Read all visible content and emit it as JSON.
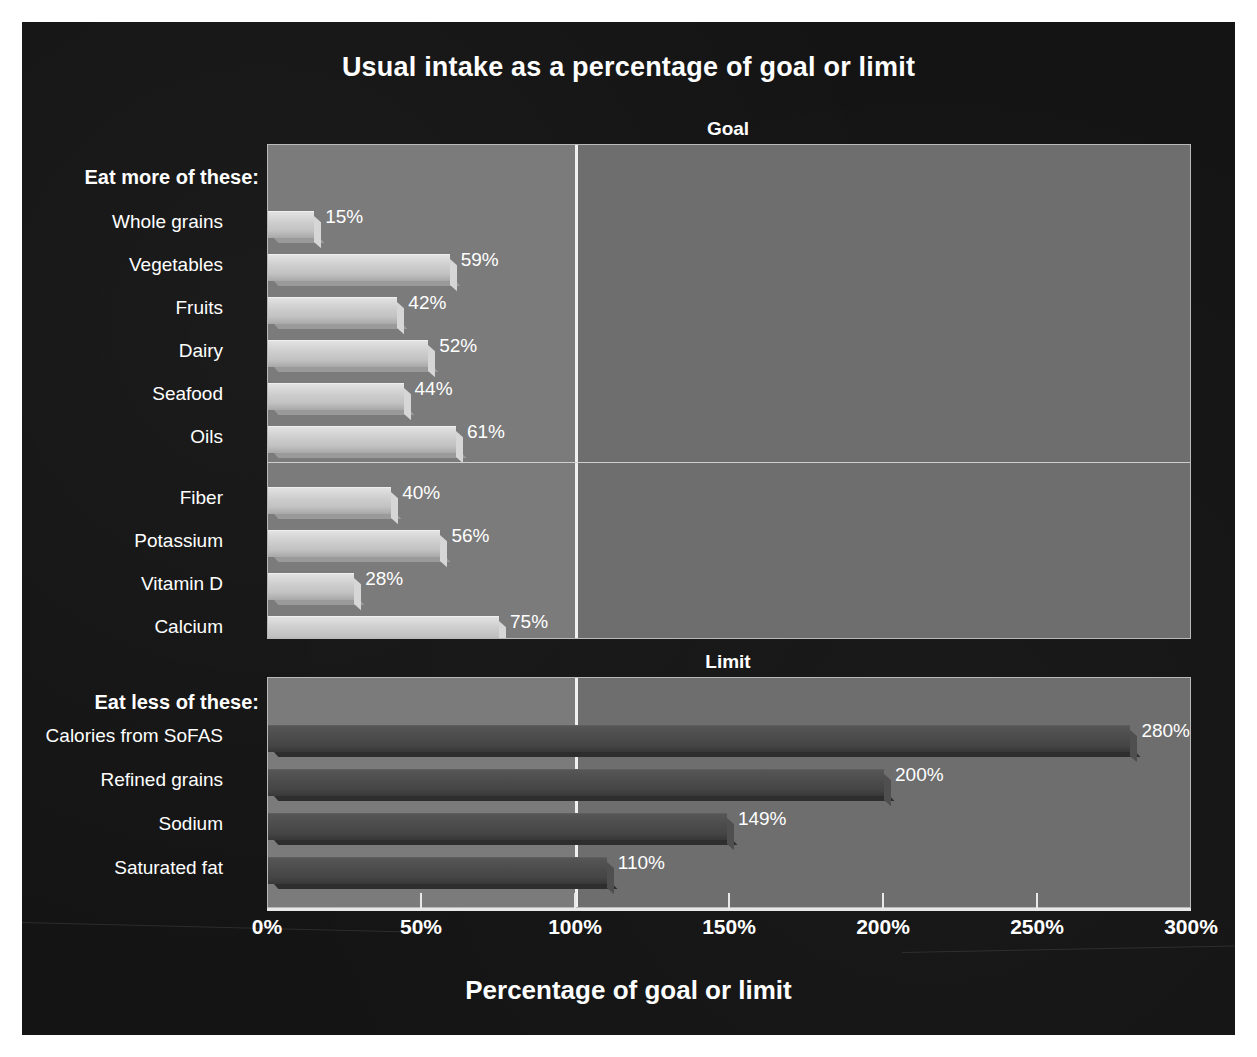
{
  "chart_data": {
    "type": "bar",
    "orientation": "horizontal",
    "title": "Usual intake as a percentage of goal or limit",
    "xlabel": "Percentage of goal or limit",
    "ylabel": "",
    "xlim": [
      0,
      300
    ],
    "xticks": [
      0,
      50,
      100,
      150,
      200,
      250,
      300
    ],
    "xtick_labels": [
      "0%",
      "50%",
      "100%",
      "150%",
      "200%",
      "250%",
      "300%"
    ],
    "grid": false,
    "reference_line": 100,
    "legend": "none",
    "panels": [
      {
        "caption": "Goal",
        "section_label": "Eat more of these:",
        "bar_style": "light",
        "groups": [
          {
            "name": "food groups",
            "categories": [
              "Whole grains",
              "Vegetables",
              "Fruits",
              "Dairy",
              "Seafood",
              "Oils"
            ],
            "values": [
              15,
              59,
              42,
              52,
              44,
              61
            ],
            "value_labels": [
              "15%",
              "59%",
              "42%",
              "52%",
              "44%",
              "61%"
            ]
          },
          {
            "name": "nutrients",
            "categories": [
              "Fiber",
              "Potassium",
              "Vitamin D",
              "Calcium"
            ],
            "values": [
              40,
              56,
              28,
              75
            ],
            "value_labels": [
              "40%",
              "56%",
              "28%",
              "75%"
            ]
          }
        ]
      },
      {
        "caption": "Limit",
        "section_label": "Eat less of these:",
        "bar_style": "dark",
        "groups": [
          {
            "name": "limits",
            "categories": [
              "Calories from SoFAS",
              "Refined grains",
              "Sodium",
              "Saturated fat"
            ],
            "values": [
              280,
              200,
              149,
              110
            ],
            "value_labels": [
              "280%",
              "200%",
              "149%",
              "110%"
            ]
          }
        ]
      }
    ]
  },
  "colors": {
    "background": "#141414",
    "panel_over_limit": "#6e6e6e",
    "panel_under_limit": "#7b7b7b",
    "reference_line": "#f0f0f0",
    "bar_light": "#cdcdcd",
    "bar_dark": "#4b4b4b",
    "text": "#ffffff"
  },
  "title": "Usual intake as a percentage of goal or limit",
  "axis_title": "Percentage of goal or limit",
  "goal": {
    "caption": "Goal",
    "section_label": "Eat more of these:",
    "rows": [
      {
        "label": "Whole grains",
        "value": 15,
        "value_label": "15%"
      },
      {
        "label": "Vegetables",
        "value": 59,
        "value_label": "59%"
      },
      {
        "label": "Fruits",
        "value": 42,
        "value_label": "42%"
      },
      {
        "label": "Dairy",
        "value": 52,
        "value_label": "52%"
      },
      {
        "label": "Seafood",
        "value": 44,
        "value_label": "44%"
      },
      {
        "label": "Oils",
        "value": 61,
        "value_label": "61%"
      },
      {
        "label": "Fiber",
        "value": 40,
        "value_label": "40%"
      },
      {
        "label": "Potassium",
        "value": 56,
        "value_label": "56%"
      },
      {
        "label": "Vitamin D",
        "value": 28,
        "value_label": "28%"
      },
      {
        "label": "Calcium",
        "value": 75,
        "value_label": "75%"
      }
    ]
  },
  "limit": {
    "caption": "Limit",
    "section_label": "Eat less of these:",
    "rows": [
      {
        "label": "Calories from SoFAS",
        "value": 280,
        "value_label": "280%"
      },
      {
        "label": "Refined grains",
        "value": 200,
        "value_label": "200%"
      },
      {
        "label": "Sodium",
        "value": 149,
        "value_label": "149%"
      },
      {
        "label": "Saturated fat",
        "value": 110,
        "value_label": "110%"
      }
    ]
  },
  "xaxis": {
    "ticks": [
      {
        "value": 0,
        "label": "0%"
      },
      {
        "value": 50,
        "label": "50%"
      },
      {
        "value": 100,
        "label": "100%"
      },
      {
        "value": 150,
        "label": "150%"
      },
      {
        "value": 200,
        "label": "200%"
      },
      {
        "value": 250,
        "label": "250%"
      },
      {
        "value": 300,
        "label": "300%"
      }
    ]
  }
}
